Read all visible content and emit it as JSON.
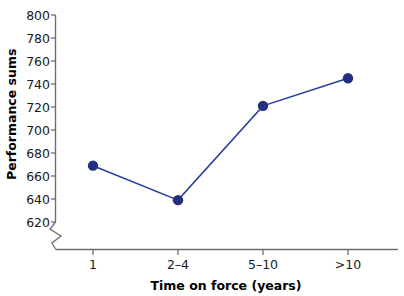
{
  "chart_data": {
    "type": "line",
    "title": "",
    "subtitle": "",
    "xlabel": "Time on force (years)",
    "ylabel": "Performance sums",
    "categories": [
      "1",
      "2–4",
      "5–10",
      ">10"
    ],
    "values": [
      669,
      639,
      721,
      745
    ],
    "series": [
      {
        "name": "Performance sums",
        "values": [
          669,
          639,
          721,
          745
        ]
      }
    ],
    "yticks": [
      620,
      640,
      660,
      680,
      700,
      720,
      740,
      760,
      780,
      800
    ],
    "ytick_labels": [
      "620",
      "640",
      "660",
      "680",
      "700",
      "720",
      "740",
      "760",
      "780",
      "800"
    ],
    "xtick_labels": [
      "1",
      "2–4",
      "5–10",
      ">10"
    ],
    "ylim": [
      620,
      800
    ],
    "grid": false,
    "legend": false,
    "legend_position": "none",
    "axis_break": true,
    "annotations": [],
    "colors": {
      "line": "#2a3f9d",
      "marker": "#24307f",
      "axis": "#6e6e6e",
      "text": "#1a1a1a",
      "background": "#ffffff"
    }
  },
  "axes": {
    "y_title": "Performance sums",
    "x_title": "Time on force (years)"
  }
}
